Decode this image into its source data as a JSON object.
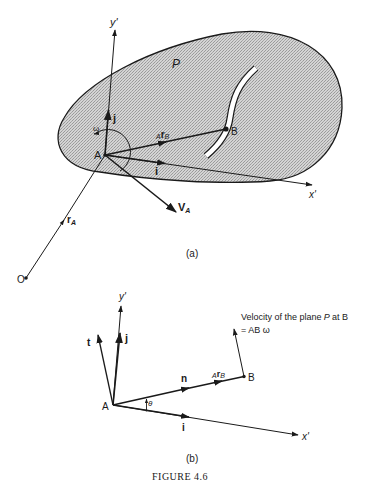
{
  "figure": {
    "caption": "FIGURE 4.6",
    "background": "#ffffff",
    "ink_color": "#1a1a1a",
    "shading_color": "#c8c8c8"
  },
  "panel_a": {
    "sublabel": "(a)",
    "plane_label": "P",
    "y_axis": "y'",
    "x_axis": "x'",
    "origin_point": "O",
    "point_A": "A",
    "point_B": "B",
    "unit_j": "j",
    "unit_i": "i",
    "omega": "ω",
    "vec_rB_prefix": "A",
    "vec_rB": "r",
    "vec_rB_sub": "B",
    "vec_VA": "V",
    "vec_VA_sub": "A",
    "vec_rA": "r",
    "vec_rA_sub": "A"
  },
  "panel_b": {
    "sublabel": "(b)",
    "y_axis": "y'",
    "x_axis": "x'",
    "point_A": "A",
    "point_B": "B",
    "unit_t": "t",
    "unit_j": "j",
    "unit_n": "n",
    "unit_i": "i",
    "theta": "θ",
    "vec_rB_prefix": "A",
    "vec_rB": "r",
    "vec_rB_sub": "B",
    "velocity_note_line1": "Velocity of the plane",
    "velocity_note_P": "P",
    "velocity_note_at": "at B",
    "velocity_note_line2": "= AB ω"
  }
}
